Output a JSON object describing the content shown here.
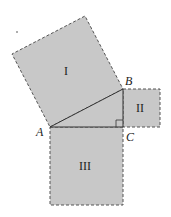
{
  "diagram": {
    "colors": {
      "fill": "#c8c8c8",
      "stroke": "#555555",
      "line": "#333333"
    },
    "vertices": [
      {
        "id": "A",
        "label": "A",
        "x": 50,
        "y": 127
      },
      {
        "id": "B",
        "label": "B",
        "x": 123,
        "y": 89
      },
      {
        "id": "C",
        "label": "C",
        "x": 123,
        "y": 127
      }
    ],
    "squares": [
      {
        "id": "I",
        "label": "I",
        "side": "AB"
      },
      {
        "id": "II",
        "label": "II",
        "side": "BC"
      },
      {
        "id": "III",
        "label": "III",
        "side": "AC"
      }
    ],
    "right_angle_at": "C"
  }
}
